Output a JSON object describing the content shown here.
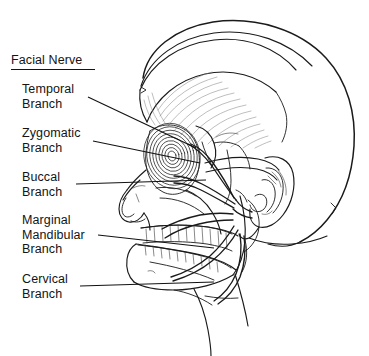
{
  "figure": {
    "type": "anatomical-illustration",
    "background_color": "#ffffff",
    "ink_color": "#1a1a1a",
    "width": 369,
    "height": 356
  },
  "title": {
    "text": "Facial Nerve",
    "underlined": true
  },
  "labels": [
    {
      "id": "temporal",
      "text": "Temporal\nBranch",
      "x": 22,
      "y": 82,
      "leader_from": [
        88,
        97
      ],
      "leader_to": [
        196,
        148
      ]
    },
    {
      "id": "zygomatic",
      "text": "Zygomatic\nBranch",
      "x": 22,
      "y": 126,
      "leader_from": [
        93,
        141
      ],
      "leader_to": [
        200,
        163
      ]
    },
    {
      "id": "buccal",
      "text": "Buccal\nBranch",
      "x": 22,
      "y": 170,
      "leader_from": [
        76,
        184
      ],
      "leader_to": [
        206,
        180
      ]
    },
    {
      "id": "marginal-mandibular",
      "text": "Marginal\nMandibular\nBranch",
      "x": 22,
      "y": 213,
      "leader_from": [
        98,
        235
      ],
      "leader_to": [
        214,
        248
      ]
    },
    {
      "id": "cervical",
      "text": "Cervical\nBranch",
      "x": 22,
      "y": 272,
      "leader_from": [
        80,
        286
      ],
      "leader_to": [
        214,
        282
      ]
    }
  ],
  "structures": [
    "cranial vault",
    "temporalis muscle",
    "orbicularis oculi",
    "zygomatic arch",
    "nasal bones",
    "maxilla with teeth",
    "mandible with teeth",
    "external ear",
    "parotid region",
    "neck"
  ],
  "icons": {
    "title_rule": "horizontal-rule"
  }
}
